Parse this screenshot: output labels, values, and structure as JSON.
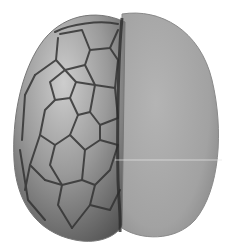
{
  "image": {
    "subject": "two-lobed embryo illustration",
    "colors": {
      "background": "#ffffff",
      "left_lobe_light": "#c4c4c4",
      "left_lobe_dark": "#6e6e6e",
      "cell_line": "#3a3a3a",
      "right_lobe": "#a8a8a8",
      "right_lobe_edge": "#7a7a7a",
      "groove": "#2a2a2a"
    }
  }
}
